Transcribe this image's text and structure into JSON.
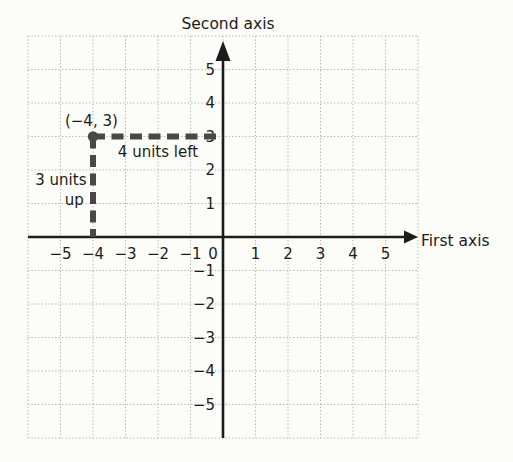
{
  "figure": {
    "width": 513,
    "height": 462,
    "background": "#fcfcf9",
    "colors": {
      "grid": "#b2b2ac",
      "axis": "#1c1c1c",
      "text": "#1c1c1c",
      "guide": "#484845"
    }
  },
  "chart_data": {
    "type": "scatter",
    "title": "",
    "xlabel": "First axis",
    "ylabel": "Second axis",
    "xlim": [
      -6,
      6
    ],
    "ylim": [
      -6,
      6
    ],
    "grid": true,
    "grid_style": "dotted",
    "x_ticks": [
      -5,
      -4,
      -3,
      -2,
      -1,
      0,
      1,
      2,
      3,
      4,
      5
    ],
    "y_ticks": [
      -5,
      -4,
      -3,
      -2,
      -1,
      1,
      2,
      3,
      4,
      5
    ],
    "points": [
      {
        "x": -4,
        "y": 3
      }
    ],
    "guide_segments": [
      {
        "x1": -4,
        "y1": 3,
        "x2": 0,
        "y2": 3,
        "style": "dashed",
        "meaning": "4 units left"
      },
      {
        "x1": -4,
        "y1": 3,
        "x2": -4,
        "y2": 0,
        "style": "dashed",
        "meaning": "3 units up"
      }
    ],
    "annotations": [
      {
        "text": "(−4, 3)",
        "x": -4.05,
        "y": 3.45,
        "anchor": "middle"
      },
      {
        "text": "4 units left",
        "x": -2.0,
        "y": 2.55,
        "anchor": "middle"
      },
      {
        "text": "3 units",
        "x": -4.2,
        "y": 1.7,
        "anchor": "end"
      },
      {
        "text": "up",
        "x": -4.28,
        "y": 1.1,
        "anchor": "end"
      }
    ]
  }
}
